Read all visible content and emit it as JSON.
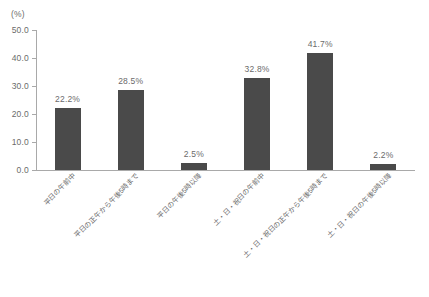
{
  "chart_data": {
    "type": "bar",
    "title": "",
    "xlabel": "",
    "ylabel": "",
    "unit_label": "(%)",
    "ylim": [
      0.0,
      50.0
    ],
    "ytick_step": 10.0,
    "grid": false,
    "legend": false,
    "bar_color": "#4a4a4a",
    "axis_color": "#a9a9a9",
    "text_color": "#6b6b6b",
    "categories": [
      "平日の午前中",
      "平日の正午から午後5時まで",
      "平日の午後5時以降",
      "土・日・祝日の午前中",
      "土・日・祝日の正午から午後5時まで",
      "土・日・祝日の午後5時以降"
    ],
    "values": [
      22.2,
      28.5,
      2.5,
      32.8,
      41.7,
      2.2
    ],
    "value_labels": [
      "22.2%",
      "28.5%",
      "2.5%",
      "32.8%",
      "41.7%",
      "2.2%"
    ],
    "ytick_labels": [
      "0.0",
      "10.0",
      "20.0",
      "30.0",
      "40.0",
      "50.0"
    ],
    "ytick_values": [
      0.0,
      10.0,
      20.0,
      30.0,
      40.0,
      50.0
    ]
  }
}
